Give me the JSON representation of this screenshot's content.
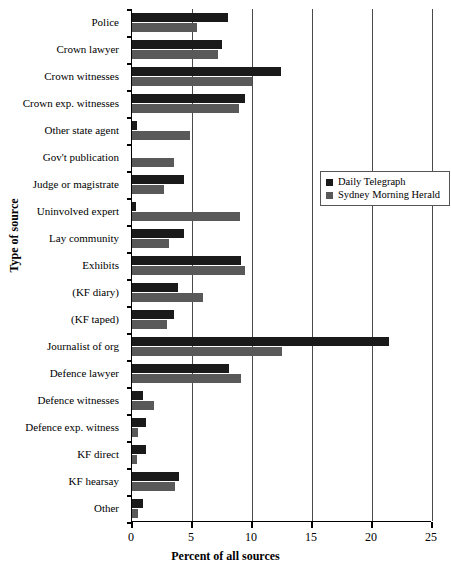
{
  "chart_data": {
    "type": "bar",
    "orientation": "horizontal",
    "title": "",
    "xlabel": "Percent of all sources",
    "ylabel": "Type of source",
    "xlim": [
      0,
      25
    ],
    "xticks": [
      0,
      5,
      10,
      15,
      20,
      25
    ],
    "xtick_labels": [
      "0",
      "5",
      "10",
      "15",
      "20",
      "25"
    ],
    "grid": true,
    "grid_axis": "x",
    "legend_position": "right-upper",
    "categories": [
      "Police",
      "Crown lawyer",
      "Crown witnesses",
      "Crown exp. witnesses",
      "Other state agent",
      "Gov't publication",
      "Judge or magistrate",
      "Uninvolved expert",
      "Lay community",
      "Exhibits",
      "(KF diary)",
      "(KF taped)",
      "Journalist of org",
      "Defence lawyer",
      "Defence witnesses",
      "Defence exp. witness",
      "KF direct",
      "KF hearsay",
      "Other"
    ],
    "series": [
      {
        "name": "Daily Telegraph",
        "color": "#1a1a1a",
        "values": [
          8.0,
          7.5,
          12.4,
          9.4,
          0.4,
          0.0,
          4.3,
          0.3,
          4.3,
          9.1,
          3.8,
          3.5,
          21.4,
          8.1,
          0.9,
          1.2,
          1.2,
          3.9,
          0.9
        ]
      },
      {
        "name": "Sydney Morning Herald",
        "color": "#595959",
        "values": [
          5.4,
          7.2,
          10.0,
          8.9,
          4.8,
          3.5,
          2.7,
          9.0,
          3.1,
          9.4,
          5.9,
          2.9,
          12.5,
          9.1,
          1.8,
          0.5,
          0.4,
          3.6,
          0.5
        ]
      }
    ]
  },
  "legend": {
    "items": [
      {
        "label": "Daily Telegraph",
        "color": "#1a1a1a"
      },
      {
        "label": "Sydney Morning Herald",
        "color": "#595959"
      }
    ]
  }
}
